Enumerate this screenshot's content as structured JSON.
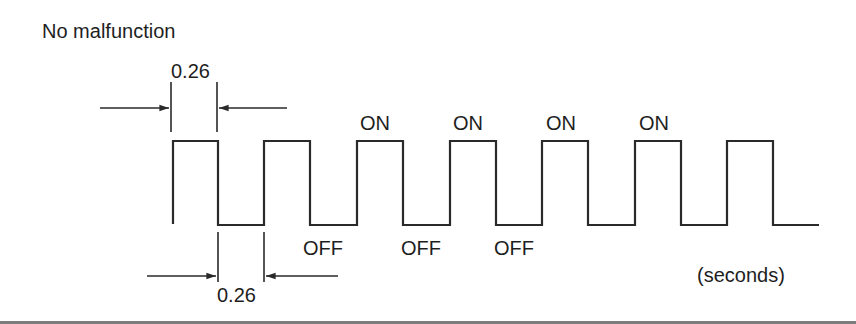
{
  "diagram": {
    "title": "No malfunction",
    "units_label": "(seconds)",
    "state_labels": {
      "on": [
        "ON",
        "ON",
        "ON",
        "ON"
      ],
      "off": [
        "OFF",
        "OFF",
        "OFF"
      ]
    },
    "dimensions": {
      "on_duration": "0.26",
      "off_duration": "0.26"
    },
    "waveform": {
      "type": "square_wave",
      "pulses": 7,
      "on_time_s": 0.26,
      "off_time_s": 0.26
    },
    "colors": {
      "line": "#2a2a2a",
      "text": "#1e1e1e",
      "rule": "#7d7d7d"
    }
  }
}
